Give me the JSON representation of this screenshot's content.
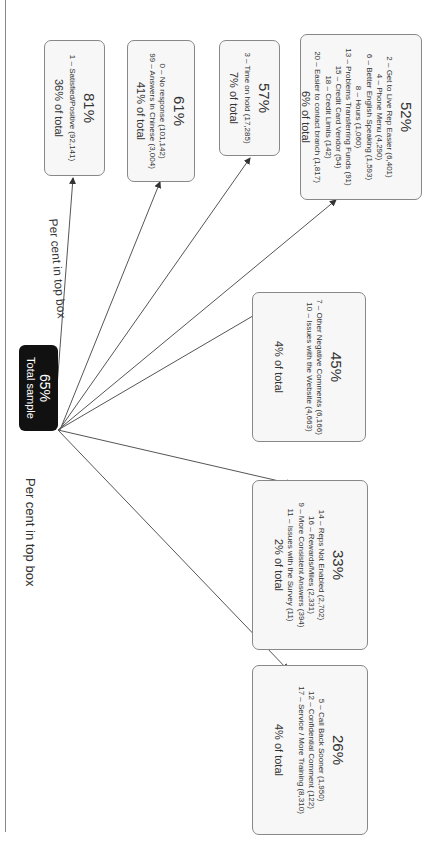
{
  "diagram": {
    "left_label": "Per cent in top box",
    "branch_label": "Per cent in top box",
    "root": {
      "percent": "65%",
      "label": "Total sample"
    },
    "nodes": [
      {
        "percent": "81%",
        "items": [
          "1 – Satisfied/Positive (92,141)"
        ],
        "total": "36% of total"
      },
      {
        "percent": "61%",
        "items": [
          "0 – No response (101,142)",
          "99 – Answers in Chinese (3,004)"
        ],
        "total": "41% of total"
      },
      {
        "percent": "57%",
        "items": [
          "3 – Time on hold (17,285)"
        ],
        "total": "7% of total"
      },
      {
        "percent": "52%",
        "items": [
          "2 – Get to Live Rep Easier (6,401)",
          "4 – Phone Menu (4,290)",
          "6 – Better English Speaking (1,593)",
          "8 – Hours (1,060)",
          "13 – Problems Transferring Funds (91)",
          "15 – Credit Card Vendor (54)",
          "18 – Credit Limits (142)",
          "20 – Easier to contact branch (1,817)"
        ],
        "total": "6% of total"
      },
      {
        "percent": "45%",
        "items": [
          "7 – Other Negative Comments (6,166)",
          "10 – Issues with the Website (4,663)"
        ],
        "total": "4% of total"
      },
      {
        "percent": "33%",
        "items": [
          "14 – Reps Not Enabled (2,702)",
          "16 – Rewards/Miles (2,331)",
          "9 – More Consistent Answers (394)",
          "11 – Issues with the Survey (11)"
        ],
        "total": "2% of total"
      },
      {
        "percent": "26%",
        "items": [
          "5 – Call Back Sooner (1,950)",
          "12 – Confidential Comment (122)",
          "17 – Service / More Training (8,310)"
        ],
        "total": "4% of total"
      }
    ],
    "colors": {
      "root_fill": "#111111",
      "node_fill": "#f7f7f7",
      "border": "#888888",
      "line": "#555555"
    }
  }
}
